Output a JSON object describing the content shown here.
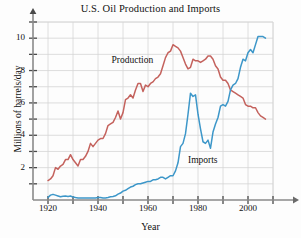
{
  "chart_data": {
    "type": "line",
    "title": "U.S. Oil Production and Imports",
    "xlabel": "Year",
    "ylabel": "Millions of barrels/day",
    "xlim": [
      1914,
      2010
    ],
    "ylim": [
      0,
      11
    ],
    "grid": true,
    "legend_position": "inline-annotations",
    "x_ticks": [
      1920,
      1930,
      1940,
      1950,
      1960,
      1970,
      1980,
      1990,
      2000,
      2010
    ],
    "x_tick_labels": [
      "1920",
      "",
      "1940",
      "",
      "1960",
      "",
      "1980",
      "",
      "2000",
      ""
    ],
    "y_ticks": [
      1,
      2,
      3,
      4,
      5,
      6,
      7,
      8,
      9,
      10,
      11
    ],
    "y_tick_labels": [
      "",
      "2",
      "",
      "4",
      "",
      "6",
      "",
      "8",
      "",
      "10",
      ""
    ],
    "series": [
      {
        "name": "Production",
        "color": "#c4625d",
        "label_x": 1955,
        "label_y": 8.6,
        "x": [
          1920,
          1921,
          1922,
          1923,
          1924,
          1925,
          1926,
          1927,
          1928,
          1929,
          1930,
          1931,
          1932,
          1933,
          1934,
          1935,
          1936,
          1937,
          1938,
          1939,
          1940,
          1941,
          1942,
          1943,
          1944,
          1945,
          1946,
          1947,
          1948,
          1949,
          1950,
          1951,
          1952,
          1953,
          1954,
          1955,
          1956,
          1957,
          1958,
          1959,
          1960,
          1961,
          1962,
          1963,
          1964,
          1965,
          1966,
          1967,
          1968,
          1969,
          1970,
          1971,
          1972,
          1973,
          1974,
          1975,
          1976,
          1977,
          1978,
          1979,
          1980,
          1981,
          1982,
          1983,
          1984,
          1985,
          1986,
          1987,
          1988,
          1989,
          1990,
          1991,
          1992,
          1993,
          1994,
          1995,
          1996,
          1997,
          1998,
          1999,
          2000,
          2001,
          2002,
          2003,
          2004,
          2005,
          2006,
          2007
        ],
        "values": [
          1.2,
          1.3,
          1.5,
          2.0,
          1.9,
          2.1,
          2.2,
          2.5,
          2.5,
          2.8,
          2.5,
          2.3,
          2.1,
          2.5,
          2.5,
          2.7,
          3.0,
          3.5,
          3.3,
          3.5,
          3.7,
          3.8,
          3.8,
          4.1,
          4.6,
          4.7,
          4.8,
          5.1,
          5.5,
          5.0,
          5.4,
          6.2,
          6.3,
          6.5,
          6.3,
          6.8,
          7.2,
          7.2,
          6.7,
          7.1,
          7.0,
          7.2,
          7.3,
          7.5,
          7.6,
          7.8,
          8.3,
          8.8,
          9.1,
          9.2,
          9.6,
          9.5,
          9.4,
          9.2,
          8.8,
          8.4,
          8.1,
          8.2,
          8.7,
          8.6,
          8.6,
          8.5,
          8.6,
          8.7,
          8.9,
          8.9,
          8.7,
          8.3,
          8.1,
          7.6,
          7.4,
          7.4,
          7.2,
          6.8,
          6.7,
          6.6,
          6.5,
          6.4,
          6.3,
          5.9,
          5.8,
          5.8,
          5.7,
          5.7,
          5.4,
          5.2,
          5.1,
          5.0
        ]
      },
      {
        "name": "Imports",
        "color": "#3d97c9",
        "label_x": 1984,
        "label_y": 2.4,
        "x": [
          1920,
          1921,
          1922,
          1923,
          1924,
          1925,
          1926,
          1927,
          1928,
          1929,
          1930,
          1931,
          1932,
          1933,
          1934,
          1935,
          1936,
          1937,
          1938,
          1939,
          1940,
          1941,
          1942,
          1943,
          1944,
          1945,
          1946,
          1947,
          1948,
          1949,
          1950,
          1951,
          1952,
          1953,
          1954,
          1955,
          1956,
          1957,
          1958,
          1959,
          1960,
          1961,
          1962,
          1963,
          1964,
          1965,
          1966,
          1967,
          1968,
          1969,
          1970,
          1971,
          1972,
          1973,
          1974,
          1975,
          1976,
          1977,
          1978,
          1979,
          1980,
          1981,
          1982,
          1983,
          1984,
          1985,
          1986,
          1987,
          1988,
          1989,
          1990,
          1991,
          1992,
          1993,
          1994,
          1995,
          1996,
          1997,
          1998,
          1999,
          2000,
          2001,
          2002,
          2003,
          2004,
          2005,
          2006,
          2007
        ],
        "values": [
          0.15,
          0.3,
          0.35,
          0.3,
          0.25,
          0.2,
          0.23,
          0.25,
          0.22,
          0.25,
          0.18,
          0.15,
          0.13,
          0.12,
          0.12,
          0.13,
          0.13,
          0.13,
          0.12,
          0.13,
          0.15,
          0.15,
          0.12,
          0.13,
          0.16,
          0.2,
          0.22,
          0.26,
          0.36,
          0.43,
          0.55,
          0.6,
          0.7,
          0.8,
          0.85,
          0.95,
          1.0,
          1.0,
          1.05,
          1.1,
          1.15,
          1.15,
          1.25,
          1.25,
          1.3,
          1.4,
          1.4,
          1.3,
          1.4,
          1.5,
          1.5,
          1.8,
          2.3,
          3.3,
          3.5,
          4.1,
          5.3,
          6.6,
          6.4,
          6.5,
          5.3,
          4.4,
          3.6,
          3.5,
          3.7,
          3.2,
          4.2,
          4.7,
          5.1,
          5.8,
          5.9,
          5.8,
          6.1,
          6.8,
          7.1,
          7.2,
          7.5,
          8.2,
          8.7,
          8.6,
          9.1,
          9.3,
          9.1,
          9.6,
          10.1,
          10.1,
          10.1,
          10.0
        ]
      }
    ]
  }
}
